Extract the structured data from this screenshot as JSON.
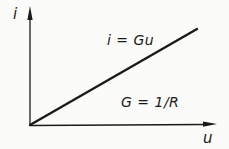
{
  "figure": {
    "background": "#fbfbf9",
    "ink": "#1a1a1a"
  },
  "chart_data": {
    "type": "line",
    "title": "",
    "xlabel": "u",
    "ylabel": "i",
    "x": [
      0,
      1
    ],
    "series": [
      {
        "name": "i = Gu",
        "values": [
          0,
          1
        ]
      }
    ],
    "xlim": [
      0,
      1
    ],
    "ylim": [
      0,
      1
    ],
    "grid": false,
    "ticks": "none",
    "legend_position": "none",
    "axis_arrows": true,
    "annotations": [
      {
        "text": "i = Gu",
        "location": "above line, upper middle"
      },
      {
        "text": "G = 1/R",
        "location": "below line, lower right"
      }
    ]
  }
}
